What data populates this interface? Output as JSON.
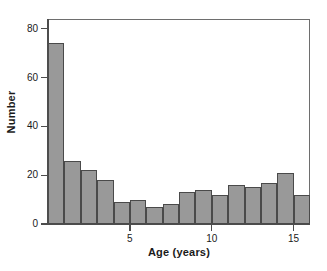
{
  "chart_data": {
    "type": "bar",
    "title": "",
    "subtitle": "",
    "xlabel": "Age (years)",
    "ylabel": "Number",
    "xlim": [
      0,
      16
    ],
    "ylim": [
      0,
      84
    ],
    "bin_width": 1,
    "bin_starts": [
      0,
      1,
      2,
      3,
      4,
      5,
      6,
      7,
      8,
      9,
      10,
      11,
      12,
      13,
      14,
      15
    ],
    "categories": [
      "0-1",
      "1-2",
      "2-3",
      "3-4",
      "4-5",
      "5-6",
      "6-7",
      "7-8",
      "8-9",
      "9-10",
      "10-11",
      "11-12",
      "12-13",
      "13-14",
      "14-15",
      "15-16"
    ],
    "values": [
      74,
      26,
      22,
      18,
      9,
      10,
      7,
      8,
      13,
      14,
      12,
      16,
      15,
      17,
      21,
      12
    ],
    "xticks": [
      5,
      10,
      15
    ],
    "xtick_labels": [
      "5",
      "10",
      "15"
    ],
    "yticks": [
      0,
      20,
      40,
      60,
      80
    ],
    "ytick_labels": [
      "0",
      "20",
      "40",
      "60",
      "80"
    ],
    "grid": false,
    "legend": false,
    "legend_position": "none",
    "bar_fill_color": "#999999",
    "bar_edge_color": "#4a4a4a",
    "axis_color": "#4d4d4d",
    "frame_color": "#6e6e6e",
    "background_color": "#ffffff"
  }
}
